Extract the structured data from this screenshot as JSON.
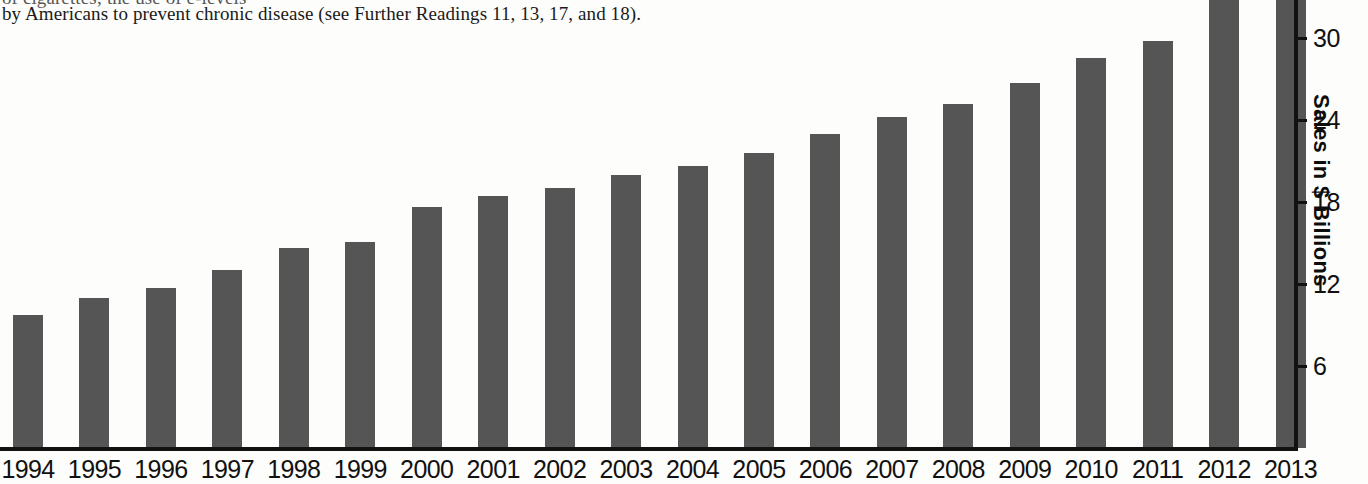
{
  "body_text": {
    "line1": "of cigarettes; the use of e-levels",
    "line2": "by Americans to prevent chronic disease (see Further Readings 11, 13, 17, and 18)."
  },
  "chart_data": {
    "type": "bar",
    "title": "",
    "subtitle": "",
    "xlabel": "",
    "ylabel": "Sales in $ Billions",
    "categories": [
      "1994",
      "1995",
      "1996",
      "1997",
      "1998",
      "1999",
      "2000",
      "2001",
      "2002",
      "2003",
      "2004",
      "2005",
      "2006",
      "2007",
      "2008",
      "2009",
      "2010",
      "2011",
      "2012",
      "2013"
    ],
    "values": [
      9.7,
      11.0,
      11.7,
      13.0,
      14.6,
      15.1,
      17.6,
      18.4,
      19.0,
      20.0,
      20.6,
      21.6,
      23.0,
      24.2,
      25.2,
      26.7,
      28.5,
      29.8,
      33.0,
      33.0
    ],
    "ylim": [
      0,
      33
    ],
    "ytick_values": [
      6,
      12,
      18,
      24,
      30
    ],
    "ytick_labels": [
      "6",
      "12",
      "18",
      "24",
      "30"
    ],
    "grid": false,
    "legend": false,
    "bar_color": "#555555",
    "axis_color": "#121212",
    "text_color": "#111111",
    "background": "#fdfdfb"
  }
}
